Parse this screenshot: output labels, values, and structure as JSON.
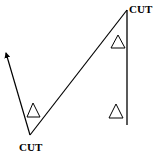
{
  "diagram": {
    "labels": {
      "top_cut": "CUT",
      "bottom_cut": "CUT"
    },
    "colors": {
      "stroke": "#000000",
      "background": "#ffffff"
    },
    "triangle_symbol": "delta",
    "elements": [
      {
        "type": "arrow-line",
        "from": [
          30,
          135
        ],
        "to": [
          5,
          51
        ]
      },
      {
        "type": "line",
        "from": [
          30,
          135
        ],
        "to": [
          127,
          10
        ]
      },
      {
        "type": "line",
        "from": [
          127,
          10
        ],
        "to": [
          127,
          125
        ]
      },
      {
        "type": "triangle",
        "apex": [
          33,
          103
        ],
        "base": [
          [
            27,
            117
          ],
          [
            40,
            117
          ]
        ]
      },
      {
        "type": "triangle",
        "apex": [
          118,
          35
        ],
        "base": [
          [
            111,
            48
          ],
          [
            125,
            48
          ]
        ]
      },
      {
        "type": "triangle",
        "apex": [
          116,
          104
        ],
        "base": [
          [
            109,
            118
          ],
          [
            123,
            118
          ]
        ]
      }
    ]
  }
}
